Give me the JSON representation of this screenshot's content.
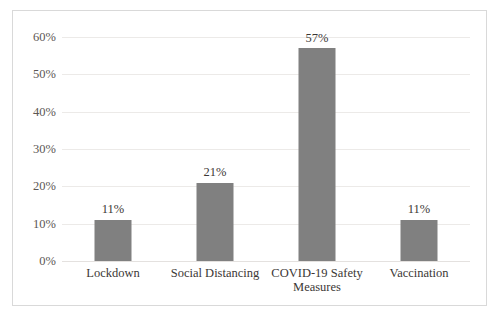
{
  "chart_data": {
    "type": "bar",
    "title": "",
    "subtitle": "",
    "xlabel": "",
    "ylabel": "",
    "categories": [
      "Lockdown",
      "Social Distancing",
      "COVID-19 Safety Measures",
      "Vaccination"
    ],
    "category_lines": [
      [
        "Lockdown"
      ],
      [
        "Social Distancing"
      ],
      [
        "COVID-19 Safety",
        "Measures"
      ],
      [
        "Vaccination"
      ]
    ],
    "values": [
      11,
      21,
      57,
      11
    ],
    "data_labels": [
      "11%",
      "21%",
      "57%",
      "11%"
    ],
    "ylim": [
      0,
      60
    ],
    "ytick_values": [
      0,
      10,
      20,
      30,
      40,
      50,
      60
    ],
    "ytick_labels": [
      "0%",
      "10%",
      "20%",
      "30%",
      "40%",
      "50%",
      "60%"
    ],
    "grid": true,
    "grid_axis": "y",
    "legend": false,
    "legend_position": "none",
    "series": [
      {
        "name": "Share of responses",
        "values": [
          11,
          21,
          57,
          11
        ]
      }
    ]
  },
  "style": {
    "bar_color": "#808080",
    "grid_color": "#eceae8",
    "frame_color": "#d9d9d9",
    "tick_text_color": "#5c5754",
    "label_text_color": "#3b3735",
    "background": "#ffffff"
  }
}
